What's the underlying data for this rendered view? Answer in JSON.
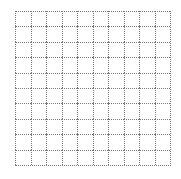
{
  "grid": {
    "rows": 10,
    "columns": 10,
    "line_style": "dotted",
    "line_color": "#7a7a7a",
    "background_color": "#ffffff"
  }
}
